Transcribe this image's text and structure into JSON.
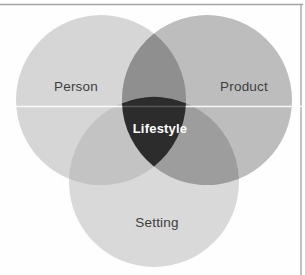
{
  "diagram": {
    "type": "venn-3-set",
    "sets": [
      {
        "id": "person",
        "label": "Person"
      },
      {
        "id": "product",
        "label": "Product"
      },
      {
        "id": "setting",
        "label": "Setting"
      }
    ],
    "center": {
      "label": "Lifestyle"
    },
    "colors": {
      "person": "#d6d6d6",
      "product": "#bdbdbd",
      "setting": "#d9d9d9",
      "person_product": "#8f8f8f",
      "person_setting": "#c3c3c3",
      "product_setting": "#9d9d9d",
      "center_fill": "#2c2c2c",
      "center_border": "#ffffff",
      "divider": "#ffffff",
      "page_border": "#a3a3a3"
    }
  }
}
